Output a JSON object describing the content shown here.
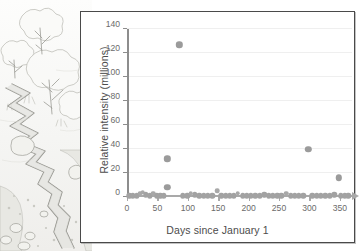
{
  "illustration": {
    "name": "pencil-sketch-river-landscape",
    "description": "Pencil sketch of a winding river with trees and rocks"
  },
  "chart_data": {
    "type": "scatter",
    "title": "",
    "xlabel": "Days since January 1",
    "ylabel": "Relative intensity (millions)",
    "xlim": [
      0,
      370
    ],
    "ylim": [
      0,
      140
    ],
    "xticks": [
      0,
      50,
      100,
      150,
      200,
      250,
      300,
      350
    ],
    "yticks": [
      0,
      20,
      40,
      60,
      80,
      100,
      120,
      140
    ],
    "grid": "horizontal",
    "legend": "none",
    "series": [
      {
        "name": "Relative intensity",
        "points": [
          {
            "x": 4,
            "y": 1
          },
          {
            "x": 10,
            "y": 1
          },
          {
            "x": 16,
            "y": 1
          },
          {
            "x": 22,
            "y": 3
          },
          {
            "x": 26,
            "y": 4
          },
          {
            "x": 31,
            "y": 2
          },
          {
            "x": 37,
            "y": 1
          },
          {
            "x": 43,
            "y": 3
          },
          {
            "x": 49,
            "y": 1
          },
          {
            "x": 55,
            "y": 1
          },
          {
            "x": 61,
            "y": 1
          },
          {
            "x": 66,
            "y": 8
          },
          {
            "x": 66,
            "y": 32
          },
          {
            "x": 86,
            "y": 127
          },
          {
            "x": 92,
            "y": 1
          },
          {
            "x": 99,
            "y": 1
          },
          {
            "x": 105,
            "y": 3
          },
          {
            "x": 112,
            "y": 2
          },
          {
            "x": 119,
            "y": 1
          },
          {
            "x": 126,
            "y": 1
          },
          {
            "x": 133,
            "y": 1
          },
          {
            "x": 140,
            "y": 1
          },
          {
            "x": 148,
            "y": 5
          },
          {
            "x": 155,
            "y": 1
          },
          {
            "x": 162,
            "y": 1
          },
          {
            "x": 169,
            "y": 1
          },
          {
            "x": 176,
            "y": 1
          },
          {
            "x": 182,
            "y": 3
          },
          {
            "x": 190,
            "y": 1
          },
          {
            "x": 197,
            "y": 1
          },
          {
            "x": 204,
            "y": 1
          },
          {
            "x": 211,
            "y": 1
          },
          {
            "x": 218,
            "y": 1
          },
          {
            "x": 226,
            "y": 2
          },
          {
            "x": 233,
            "y": 1
          },
          {
            "x": 240,
            "y": 1
          },
          {
            "x": 247,
            "y": 1
          },
          {
            "x": 254,
            "y": 1
          },
          {
            "x": 262,
            "y": 3
          },
          {
            "x": 269,
            "y": 1
          },
          {
            "x": 276,
            "y": 1
          },
          {
            "x": 283,
            "y": 1
          },
          {
            "x": 290,
            "y": 1
          },
          {
            "x": 298,
            "y": 40
          },
          {
            "x": 305,
            "y": 1
          },
          {
            "x": 312,
            "y": 1
          },
          {
            "x": 319,
            "y": 1
          },
          {
            "x": 326,
            "y": 1
          },
          {
            "x": 334,
            "y": 1
          },
          {
            "x": 341,
            "y": 2
          },
          {
            "x": 348,
            "y": 16
          },
          {
            "x": 352,
            "y": 1
          },
          {
            "x": 358,
            "y": 1
          },
          {
            "x": 364,
            "y": 1
          }
        ]
      }
    ]
  },
  "colors": {
    "point": "#9b9b9b",
    "axis": "#8d8d8d",
    "grid": "#efefef",
    "text": "#4c4c4c",
    "panel_border": "#4a4a4a"
  }
}
